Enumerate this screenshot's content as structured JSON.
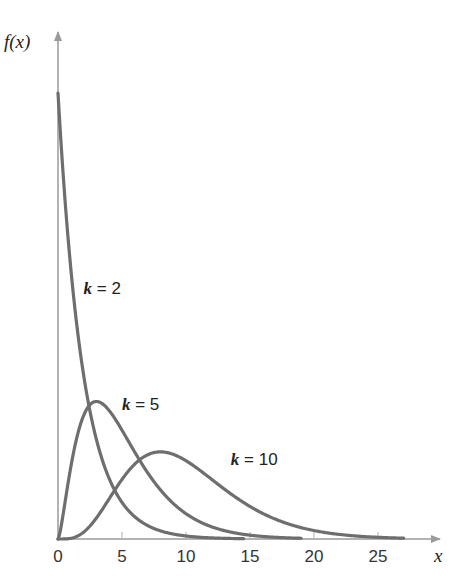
{
  "chart_data": {
    "type": "line",
    "title": "",
    "xlabel": "x",
    "ylabel": "f(x)",
    "xlim": [
      0,
      29
    ],
    "ylim": [
      0,
      0.56
    ],
    "xticks": [
      0,
      5,
      10,
      15,
      20,
      25
    ],
    "xtick_labels": [
      "0",
      "5",
      "10",
      "15",
      "20",
      "25"
    ],
    "grid": false,
    "legend": "none (inline curve labels)",
    "series": [
      {
        "name": "k = 2",
        "k": 2,
        "x_range": [
          0,
          14.5
        ],
        "points": [
          [
            0,
            0.5
          ],
          [
            1,
            0.303
          ],
          [
            2,
            0.184
          ],
          [
            3,
            0.112
          ],
          [
            4,
            0.068
          ],
          [
            6,
            0.025
          ],
          [
            8,
            0.009
          ],
          [
            10,
            0.003
          ],
          [
            14.5,
            0.0004
          ]
        ],
        "label": {
          "k_text": "k",
          "eq_text": " = 2",
          "x": 2.0,
          "y": 0.275
        }
      },
      {
        "name": "k = 5",
        "k": 5,
        "x_range": [
          0,
          19
        ],
        "points": [
          [
            0,
            0
          ],
          [
            1,
            0.081
          ],
          [
            2,
            0.138
          ],
          [
            3,
            0.154
          ],
          [
            4,
            0.144
          ],
          [
            6,
            0.097
          ],
          [
            8,
            0.055
          ],
          [
            10,
            0.028
          ],
          [
            15,
            0.004
          ],
          [
            19,
            0.0006
          ]
        ],
        "label": {
          "k_text": "k",
          "eq_text": " = 5",
          "x": 5.0,
          "y": 0.145
        }
      },
      {
        "name": "k = 10",
        "k": 10,
        "x_range": [
          0,
          27
        ],
        "points": [
          [
            0,
            0
          ],
          [
            2,
            0.015
          ],
          [
            4,
            0.054
          ],
          [
            6,
            0.085
          ],
          [
            8,
            0.098
          ],
          [
            10,
            0.088
          ],
          [
            12,
            0.067
          ],
          [
            15,
            0.034
          ],
          [
            20,
            0.008
          ],
          [
            25,
            0.001
          ],
          [
            27,
            0.0005
          ]
        ],
        "label": {
          "k_text": "k",
          "eq_text": " = 10",
          "x": 13.5,
          "y": 0.083
        }
      }
    ]
  },
  "axes": {
    "x_label": "x",
    "y_label": "f(x)"
  },
  "colors": {
    "curve": "#6e6e6e",
    "axis": "#9a9a9a",
    "text": "#222222"
  }
}
